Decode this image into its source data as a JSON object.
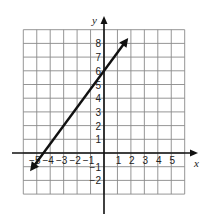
{
  "chart_data": {
    "type": "line",
    "title": "",
    "xlabel": "x",
    "ylabel": "y",
    "xlim": [
      -6,
      6
    ],
    "ylim": [
      -3,
      9
    ],
    "grid": true,
    "x_tick_labels": [
      "-5",
      "-4",
      "-3",
      "-2",
      "-1",
      "1",
      "2",
      "3",
      "4",
      "5"
    ],
    "x_ticks": [
      -5,
      -4,
      -3,
      -2,
      -1,
      1,
      2,
      3,
      4,
      5
    ],
    "y_tick_labels": [
      "-2",
      "-1",
      "1",
      "2",
      "3",
      "4",
      "5",
      "6",
      "7",
      "8"
    ],
    "y_ticks": [
      -2,
      -1,
      1,
      2,
      3,
      4,
      5,
      6,
      7,
      8
    ],
    "series": [
      {
        "name": "line",
        "equation": "y = (4/3)x + 6",
        "slope": 1.3333,
        "y_intercept": 6,
        "x_intercept": -4.5,
        "arrows_both_ends": true,
        "points": [
          [
            -5.5,
            -1.33
          ],
          [
            -4.5,
            0
          ],
          [
            -3,
            2
          ],
          [
            0,
            6
          ],
          [
            1.8,
            8.4
          ]
        ]
      }
    ]
  },
  "style": {
    "grid_color": "#8a8a8a",
    "axis_color": "#111111",
    "line_color": "#111111"
  }
}
